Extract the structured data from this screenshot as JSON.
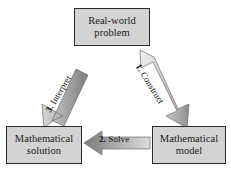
{
  "diagram": {
    "background_color": "#ffffff",
    "box_fill_color": "#d3d3d3",
    "box_border_color": "#2b2b2b",
    "arrow_fill_light": "#e3e3e3",
    "arrow_fill_dark": "#8a8a8a",
    "nodes": [
      {
        "id": "real-world-problem",
        "line1": "Real-world",
        "line2": "problem"
      },
      {
        "id": "mathematical-solution",
        "line1": "Mathematical",
        "line2": "solution"
      },
      {
        "id": "mathematical-model",
        "line1": "Mathematical",
        "line2": "model"
      }
    ],
    "arrows": [
      {
        "id": "construct",
        "number": "1.",
        "label": "Construct",
        "from": "real-world-problem",
        "to": "mathematical-model",
        "direction": "down-right"
      },
      {
        "id": "solve",
        "number": "2.",
        "label": "Solve",
        "from": "mathematical-model",
        "to": "mathematical-solution",
        "direction": "left"
      },
      {
        "id": "interpret",
        "number": "3.",
        "label": "Interpret",
        "from": "mathematical-solution",
        "to": "real-world-problem",
        "direction": "up-right"
      }
    ]
  }
}
